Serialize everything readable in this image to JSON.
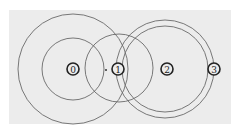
{
  "diagram": {
    "type": "concentric-circle-node-diagram",
    "background_color": "#ececec",
    "panel": {
      "x": 9,
      "y": 10,
      "width": 222,
      "height": 114
    },
    "nodes": [
      {
        "id": "0",
        "label": "0",
        "cx": 73,
        "cy": 69,
        "r": 6
      },
      {
        "id": "1",
        "label": "1",
        "cx": 118,
        "cy": 69,
        "r": 6
      },
      {
        "id": "2",
        "label": "2",
        "cx": 167,
        "cy": 69,
        "r": 6
      },
      {
        "id": "3",
        "label": "3",
        "cx": 214,
        "cy": 69,
        "r": 6
      }
    ],
    "marker_dot": {
      "cx": 106,
      "cy": 70,
      "r": 1
    },
    "rings": [
      {
        "name": "node-0-outer-ring",
        "cx": 73,
        "cy": 69,
        "r": 55
      },
      {
        "name": "node-0-inner-ring",
        "cx": 73,
        "cy": 69,
        "r": 31
      },
      {
        "name": "node-1-ring",
        "cx": 119,
        "cy": 68,
        "r": 34
      },
      {
        "name": "node-2-inner-ring",
        "cx": 165,
        "cy": 69,
        "r": 43
      },
      {
        "name": "node-2-outer-ring",
        "cx": 165,
        "cy": 69,
        "r": 49
      }
    ]
  }
}
